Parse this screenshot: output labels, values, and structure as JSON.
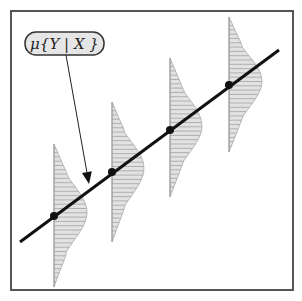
{
  "figure": {
    "frame": {
      "x": 11,
      "y": 11,
      "width": 282,
      "height": 279,
      "stroke": "#555555"
    },
    "regression_line": {
      "x1": 20,
      "y1": 242,
      "x2": 279,
      "y2": 50,
      "color": "#111111",
      "width": 3
    },
    "label": {
      "text": "μ{Y | X }",
      "box": {
        "x": 25,
        "y": 32,
        "width": 79,
        "height": 23,
        "rx": 11,
        "fill": "#e6e6e6",
        "stroke": "#333333"
      },
      "arrow": {
        "x1": 66,
        "y1": 55,
        "x2": 89,
        "y2": 184
      }
    },
    "bar_color": "#aaaaaa",
    "bar_fill": "#e2e2e2",
    "distributions": [
      {
        "name": "distribution-1",
        "x": 54,
        "top": 144,
        "bottom": 287,
        "peak_y": 212,
        "peak_width": 33,
        "mean_y": 216
      },
      {
        "name": "distribution-2",
        "x": 112,
        "top": 102,
        "bottom": 242,
        "peak_y": 168,
        "peak_width": 32,
        "mean_y": 172
      },
      {
        "name": "distribution-3",
        "x": 170,
        "top": 58,
        "bottom": 197,
        "peak_y": 126,
        "peak_width": 32,
        "mean_y": 130
      },
      {
        "name": "distribution-4",
        "x": 229,
        "top": 17,
        "bottom": 152,
        "peak_y": 81,
        "peak_width": 33,
        "mean_y": 85
      }
    ]
  }
}
